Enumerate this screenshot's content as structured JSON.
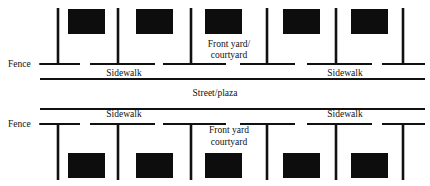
{
  "diagram": {
    "canvas": {
      "width": 430,
      "height": 186,
      "background": "#ffffff"
    },
    "ink_color": "#111111",
    "building_color": "#0d0d0d",
    "labels": {
      "fence_top": "Fence",
      "fence_bottom": "Fence",
      "sidewalk_top_left": "Sidewalk",
      "sidewalk_top_right": "Sidewalk",
      "sidewalk_bottom_left": "Sidewalk",
      "sidewalk_bottom_right": "Sidewalk",
      "front_yard_top_line1": "Front yard/",
      "front_yard_top_line2": "courtyard",
      "front_yard_bottom_line1": "Front yard",
      "front_yard_bottom_line2": "courtyard",
      "street": "Street/plaza"
    },
    "top_block": {
      "buildings": [
        {
          "x": 68,
          "y": 9,
          "w": 37,
          "h": 25
        },
        {
          "x": 136,
          "y": 9,
          "w": 37,
          "h": 25
        },
        {
          "x": 205,
          "y": 9,
          "w": 37,
          "h": 25
        },
        {
          "x": 283,
          "y": 9,
          "w": 37,
          "h": 25
        },
        {
          "x": 351,
          "y": 9,
          "w": 37,
          "h": 25
        }
      ],
      "fence_posts": [
        {
          "x": 58,
          "y1": 8,
          "y2": 64
        },
        {
          "x": 118,
          "y1": 8,
          "y2": 64
        },
        {
          "x": 191,
          "y1": 8,
          "y2": 64
        },
        {
          "x": 267,
          "y1": 8,
          "y2": 64
        },
        {
          "x": 336,
          "y1": 8,
          "y2": 64
        },
        {
          "x": 403,
          "y1": 8,
          "y2": 64
        }
      ],
      "fence_rails": [
        {
          "x1": 40,
          "x2": 80,
          "y": 64
        },
        {
          "x1": 90,
          "x2": 155,
          "y": 64
        },
        {
          "x1": 163,
          "x2": 226,
          "y": 64
        },
        {
          "x1": 240,
          "x2": 295,
          "y": 64
        },
        {
          "x1": 307,
          "x2": 372,
          "y": 64
        },
        {
          "x1": 382,
          "x2": 425,
          "y": 64
        }
      ],
      "street_edge": {
        "x1": 40,
        "x2": 425,
        "y": 79
      }
    },
    "bottom_block": {
      "buildings": [
        {
          "x": 68,
          "y": 153,
          "w": 37,
          "h": 25
        },
        {
          "x": 136,
          "y": 153,
          "w": 37,
          "h": 25
        },
        {
          "x": 205,
          "y": 153,
          "w": 37,
          "h": 25
        },
        {
          "x": 283,
          "y": 153,
          "w": 37,
          "h": 25
        },
        {
          "x": 351,
          "y": 153,
          "w": 37,
          "h": 25
        }
      ],
      "fence_posts": [
        {
          "x": 58,
          "y1": 124,
          "y2": 180
        },
        {
          "x": 118,
          "y1": 124,
          "y2": 180
        },
        {
          "x": 191,
          "y1": 124,
          "y2": 180
        },
        {
          "x": 267,
          "y1": 124,
          "y2": 180
        },
        {
          "x": 336,
          "y1": 124,
          "y2": 180
        },
        {
          "x": 403,
          "y1": 124,
          "y2": 180
        }
      ],
      "fence_rails": [
        {
          "x1": 40,
          "x2": 80,
          "y": 124
        },
        {
          "x1": 90,
          "x2": 155,
          "y": 124
        },
        {
          "x1": 163,
          "x2": 226,
          "y": 124
        },
        {
          "x1": 240,
          "x2": 295,
          "y": 124
        },
        {
          "x1": 307,
          "x2": 372,
          "y": 124
        },
        {
          "x1": 382,
          "x2": 425,
          "y": 124
        }
      ],
      "street_edge": {
        "x1": 40,
        "x2": 425,
        "y": 109
      }
    },
    "leaders": {
      "fence_top": {
        "x1": 39,
        "x2": 58,
        "y": 64
      },
      "fence_bottom": {
        "x1": 39,
        "x2": 58,
        "y": 124
      }
    },
    "text_positions": {
      "fence_top": {
        "x": 8,
        "y": 67
      },
      "fence_bottom": {
        "x": 8,
        "y": 127
      },
      "sidewalk_top_left": {
        "x": 124,
        "y": 76
      },
      "sidewalk_top_right": {
        "x": 345,
        "y": 76
      },
      "sidewalk_bottom_left": {
        "x": 124,
        "y": 117
      },
      "sidewalk_bottom_right": {
        "x": 345,
        "y": 117
      },
      "front_yard_top_line1": {
        "x": 229,
        "y": 47
      },
      "front_yard_top_line2": {
        "x": 229,
        "y": 58
      },
      "front_yard_bottom_line1": {
        "x": 229,
        "y": 133
      },
      "front_yard_bottom_line2": {
        "x": 229,
        "y": 145
      },
      "street": {
        "x": 215,
        "y": 96
      }
    }
  }
}
